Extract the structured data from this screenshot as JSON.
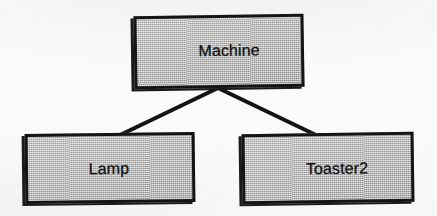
{
  "diagram": {
    "type": "uml-class-generalization",
    "canvas": {
      "width": 437,
      "height": 216
    },
    "colors": {
      "page_background": "#fcfcfc",
      "node_fill": "#b9b9b9",
      "node_border": "#141414",
      "label_text": "#121212",
      "link_stroke": "#141414"
    },
    "nodes": [
      {
        "id": "machine",
        "label": "Machine",
        "role": "superclass",
        "x": 134,
        "y": 15,
        "width": 170,
        "height": 73
      },
      {
        "id": "lamp",
        "label": "Lamp",
        "role": "subclass",
        "x": 25,
        "y": 133,
        "width": 170,
        "height": 70
      },
      {
        "id": "toaster2",
        "label": "Toaster2",
        "role": "subclass",
        "x": 242,
        "y": 133,
        "width": 172,
        "height": 70
      }
    ],
    "links": [
      {
        "id": "machine-lamp",
        "from": "machine",
        "to": "lamp",
        "kind": "generalization",
        "x1": 218,
        "y1": 88,
        "x2": 118,
        "y2": 135
      },
      {
        "id": "machine-toaster2",
        "from": "machine",
        "to": "toaster2",
        "kind": "generalization",
        "x1": 218,
        "y1": 88,
        "x2": 318,
        "y2": 135
      }
    ],
    "junction": {
      "x": 218,
      "y": 88
    }
  }
}
